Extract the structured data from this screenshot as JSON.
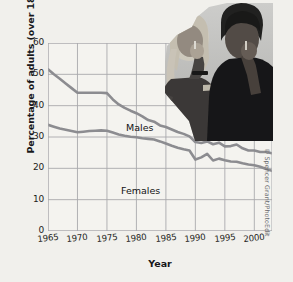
{
  "credit": "© Spencer Grant/PhotoEdit",
  "photo": {
    "alt": "two-women-smoking-photo",
    "caption": ""
  },
  "chart_data": {
    "type": "line",
    "title": "",
    "xlabel": "Year",
    "ylabel": "Percentage of adults (over 18) who smoke",
    "xlim": [
      1965,
      2003
    ],
    "ylim": [
      0,
      60
    ],
    "xticks": [
      "1965",
      "1970",
      "1975",
      "1980",
      "1985",
      "1990",
      "1995",
      "2000"
    ],
    "xtick_values": [
      1965,
      1970,
      1975,
      1980,
      1985,
      1990,
      1995,
      2000
    ],
    "yticks": [
      "0",
      "10",
      "20",
      "30",
      "40",
      "50",
      "60"
    ],
    "ytick_values": [
      0,
      10,
      20,
      30,
      40,
      50,
      60
    ],
    "grid": true,
    "legend": "inline-labels",
    "series": [
      {
        "name": "Males",
        "color": "#8c8c90",
        "label_position": "inline",
        "x": [
          1965,
          1966,
          1967,
          1968,
          1969,
          1970,
          1971,
          1972,
          1973,
          1974,
          1975,
          1976,
          1977,
          1978,
          1979,
          1980,
          1981,
          1982,
          1983,
          1984,
          1985,
          1986,
          1987,
          1988,
          1989,
          1990,
          1991,
          1992,
          1993,
          1994,
          1995,
          1996,
          1997,
          1998,
          1999,
          2000,
          2001,
          2002,
          2003
        ],
        "values": [
          51.6,
          50.0,
          48.6,
          47.1,
          45.6,
          44.1,
          44.1,
          44.1,
          44.1,
          44.1,
          44.0,
          42.0,
          40.4,
          39.3,
          38.4,
          37.6,
          36.6,
          35.4,
          34.9,
          33.7,
          33.2,
          32.4,
          31.6,
          31.0,
          30.2,
          28.4,
          28.1,
          28.6,
          27.7,
          28.2,
          27.0,
          27.1,
          27.6,
          26.4,
          25.7,
          25.7,
          25.2,
          25.2,
          24.8
        ]
      },
      {
        "name": "Females",
        "color": "#8c8c90",
        "label_position": "inline",
        "x": [
          1965,
          1966,
          1967,
          1968,
          1969,
          1970,
          1971,
          1972,
          1973,
          1974,
          1975,
          1976,
          1977,
          1978,
          1979,
          1980,
          1981,
          1982,
          1983,
          1984,
          1985,
          1986,
          1987,
          1988,
          1989,
          1990,
          1991,
          1992,
          1993,
          1994,
          1995,
          1996,
          1997,
          1998,
          1999,
          2000,
          2001,
          2002,
          2003
        ],
        "values": [
          33.9,
          33.3,
          32.7,
          32.3,
          31.9,
          31.5,
          31.7,
          31.9,
          32.0,
          32.1,
          32.0,
          31.4,
          30.8,
          30.4,
          30.1,
          29.9,
          29.6,
          29.4,
          29.2,
          28.6,
          27.9,
          27.2,
          26.6,
          26.1,
          25.7,
          22.8,
          23.5,
          24.6,
          22.5,
          23.1,
          22.6,
          22.2,
          22.1,
          21.6,
          21.2,
          21.0,
          20.5,
          19.8,
          19.2
        ]
      }
    ]
  }
}
